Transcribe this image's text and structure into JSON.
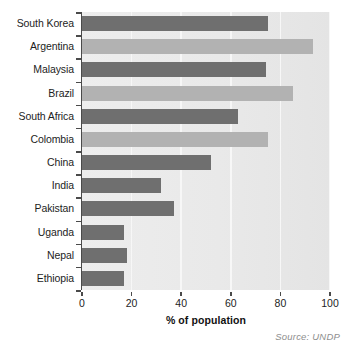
{
  "chart_data": {
    "type": "bar",
    "orientation": "horizontal",
    "title": "",
    "subtitle": "",
    "xlabel": "% of population",
    "ylabel": "",
    "xlim": [
      0,
      100
    ],
    "xticks": [
      0,
      20,
      40,
      60,
      80,
      100
    ],
    "xtick_labels": [
      "0",
      "20",
      "40",
      "60",
      "80",
      "100"
    ],
    "grid": "vertical",
    "legend": "none",
    "categories": [
      "South Korea",
      "Argentina",
      "Malaysia",
      "Brazil",
      "South Africa",
      "Colombia",
      "China",
      "India",
      "Pakistan",
      "Uganda",
      "Nepal",
      "Ethiopia"
    ],
    "values": [
      75,
      93,
      74,
      85,
      63,
      75,
      52,
      32,
      37,
      17,
      18,
      17
    ],
    "bar_shades": [
      "dark",
      "light",
      "dark",
      "light",
      "dark",
      "light",
      "dark",
      "dark",
      "dark",
      "dark",
      "dark",
      "dark"
    ],
    "annotations": [
      "Source: UNDP"
    ]
  },
  "source_note": "Source: UNDP",
  "colors": {
    "bar_dark": "#6f6f6f",
    "bar_light": "#b2b2b2",
    "plot_background": "#ebebeb",
    "gridline": "#f7f7f7",
    "axis": "#4a4a4a",
    "text": "#1d1d1d",
    "source_text": "#8e8e8e"
  }
}
